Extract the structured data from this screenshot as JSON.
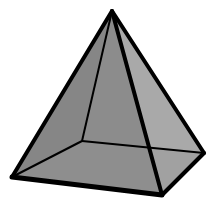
{
  "figure": {
    "colors": {
      "background": "#ffffff",
      "left_face": "#8c8c8c",
      "right_face": "#a9a9a9",
      "base_visible": "#979797",
      "edge": "#000000"
    },
    "vertices": {
      "apex": [
        112,
        11
      ],
      "back": [
        82,
        141
      ],
      "left": [
        12,
        177
      ],
      "front": [
        162,
        195
      ],
      "right": [
        204,
        153
      ]
    }
  }
}
